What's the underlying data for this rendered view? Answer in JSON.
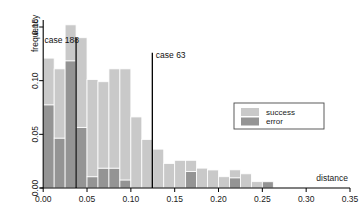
{
  "chart_data": {
    "type": "bar",
    "title": "",
    "subtitle": "",
    "xlabel": "distance",
    "ylabel": "frequency",
    "xlim": [
      0.0,
      0.3625
    ],
    "ylim": [
      0.0,
      0.1625
    ],
    "xticks": [
      "0.00",
      "0.05",
      "0.10",
      "0.15",
      "0.20",
      "0.25",
      "0.30",
      "0.35"
    ],
    "xtick_values": [
      0.0,
      0.05,
      0.1,
      0.15,
      0.2,
      0.25,
      0.3,
      0.35
    ],
    "yticks": [
      "0.00",
      "0.05",
      "0.10",
      "0.15"
    ],
    "ytick_values": [
      0.0,
      0.05,
      0.1,
      0.15
    ],
    "grid": false,
    "stacked": true,
    "bin_width": 0.0125,
    "bin_starts": [
      0.0,
      0.0125,
      0.025,
      0.0375,
      0.05,
      0.0625,
      0.075,
      0.0875,
      0.1,
      0.1125,
      0.125,
      0.1375,
      0.15,
      0.1625,
      0.175,
      0.1875,
      0.2,
      0.2125,
      0.225,
      0.2375,
      0.25,
      0.2625,
      0.275,
      0.2875,
      0.3,
      0.3125
    ],
    "legend": {
      "position": "right",
      "entries": [
        {
          "name": "success",
          "color": "#c9c9c9"
        },
        {
          "name": "error",
          "color": "#949494"
        }
      ]
    },
    "series": [
      {
        "name": "error",
        "color": "#949494",
        "values": [
          0.0775,
          0.0465,
          0.1185,
          0.0565,
          0.0105,
          0.0185,
          0.0185,
          0.0075,
          0.0,
          0.0,
          0.0,
          0.0,
          0.0,
          0.0155,
          0.0,
          0.0,
          0.0,
          0.0095,
          0.0,
          0.0,
          0.0058,
          0.0,
          0.0,
          0.0,
          0.0,
          0.0
        ]
      },
      {
        "name": "success",
        "color": "#c9c9c9",
        "values": [
          0.0435,
          0.0645,
          0.0335,
          0.0835,
          0.0905,
          0.0805,
          0.0925,
          0.1035,
          0.0662,
          0.0452,
          0.0362,
          0.0228,
          0.0258,
          0.0103,
          0.0185,
          0.0168,
          0.0105,
          0.0074,
          0.0132,
          0.0059,
          0.0,
          0.0,
          0.0,
          0.0,
          0.0,
          0.0
        ]
      }
    ],
    "totals": [
      0.121,
      0.111,
      0.152,
      0.14,
      0.101,
      0.099,
      0.111,
      0.111,
      0.0662,
      0.0452,
      0.0362,
      0.0228,
      0.0258,
      0.0258,
      0.0185,
      0.0168,
      0.0105,
      0.0169,
      0.0132,
      0.0059,
      0.0058,
      0.0,
      0.0,
      0.0,
      0.0,
      0.0
    ],
    "annotations": [
      {
        "name": "case 188",
        "x": 0.0375,
        "label": "case 188",
        "label_x": 0.0015,
        "label_y": 0.1355
      },
      {
        "name": "case 63",
        "x": 0.1245,
        "label": "case 63",
        "label_x": 0.1285,
        "label_y": 0.1215
      }
    ]
  }
}
